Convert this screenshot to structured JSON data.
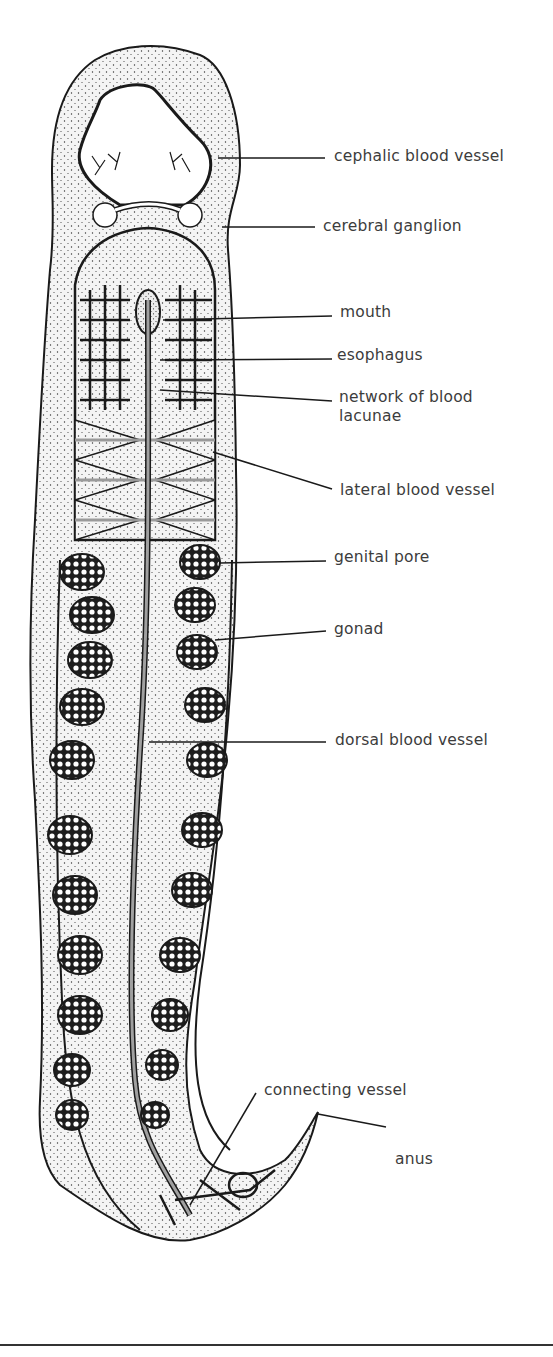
{
  "figure": {
    "colors": {
      "ink": "#1a1a1a",
      "label_text": "#3c3c3c",
      "body_fill": "#f2f2f2",
      "vessel_gray": "#9a9a9a",
      "background": "#ffffff"
    },
    "labels": [
      {
        "id": "cephalic-blood-vessel",
        "text": "cephalic blood vessel",
        "x": 334,
        "y": 147
      },
      {
        "id": "cerebral-ganglion",
        "text": "cerebral ganglion",
        "x": 323,
        "y": 217
      },
      {
        "id": "mouth",
        "text": "mouth",
        "x": 340,
        "y": 303
      },
      {
        "id": "esophagus",
        "text": "esophagus",
        "x": 337,
        "y": 346
      },
      {
        "id": "network-of-blood-lacunae",
        "text": "network of blood\nlacunae",
        "x": 339,
        "y": 388
      },
      {
        "id": "lateral-blood-vessel",
        "text": "lateral blood vessel",
        "x": 340,
        "y": 481
      },
      {
        "id": "genital-pore",
        "text": "genital pore",
        "x": 334,
        "y": 548
      },
      {
        "id": "gonad",
        "text": "gonad",
        "x": 334,
        "y": 620
      },
      {
        "id": "dorsal-blood-vessel",
        "text": "dorsal blood vessel",
        "x": 335,
        "y": 731
      },
      {
        "id": "connecting-vessel",
        "text": "connecting vessel",
        "x": 264,
        "y": 1081
      },
      {
        "id": "anus",
        "text": "anus",
        "x": 395,
        "y": 1150
      }
    ]
  }
}
